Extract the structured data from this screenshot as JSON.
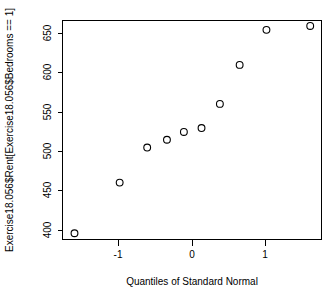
{
  "chart_data": {
    "type": "scatter",
    "title": "",
    "subtitle": "",
    "xlabel": "Quantiles of Standard Normal",
    "ylabel": "Exercise18.056$Rent[Exercise18.056$Bedrooms == 1]",
    "xlim": [
      -1.85,
      1.82
    ],
    "ylim": [
      377,
      658
    ],
    "grid": false,
    "legend": null,
    "xticks": [
      -1,
      0,
      1
    ],
    "xticklabels": [
      "-1",
      "0",
      "1"
    ],
    "yticks": [
      400,
      450,
      500,
      550,
      600,
      650
    ],
    "yticklabels": [
      "400",
      "450",
      "500",
      "550",
      "600",
      "650"
    ],
    "marker": "open-circle",
    "marker_color": "#000000",
    "points": [
      {
        "x": -1.68,
        "y": 385
      },
      {
        "x": -1.04,
        "y": 450
      },
      {
        "x": -0.65,
        "y": 495
      },
      {
        "x": -0.37,
        "y": 505
      },
      {
        "x": -0.13,
        "y": 515
      },
      {
        "x": 0.12,
        "y": 520
      },
      {
        "x": 0.38,
        "y": 551
      },
      {
        "x": 0.66,
        "y": 601
      },
      {
        "x": 1.04,
        "y": 646
      },
      {
        "x": 1.66,
        "y": 651
      }
    ],
    "series": [
      {
        "name": "Rent (1 bedroom)",
        "x": [
          -1.68,
          -1.04,
          -0.65,
          -0.37,
          -0.13,
          0.12,
          0.38,
          0.66,
          1.04,
          1.66
        ],
        "values": [
          385,
          450,
          495,
          505,
          515,
          520,
          551,
          601,
          646,
          651
        ]
      }
    ]
  },
  "axes": {
    "x_axis_title": "Quantiles of Standard Normal",
    "y_axis_title": "Exercise18.056$Rent[Exercise18.056$Bedrooms == 1]"
  }
}
